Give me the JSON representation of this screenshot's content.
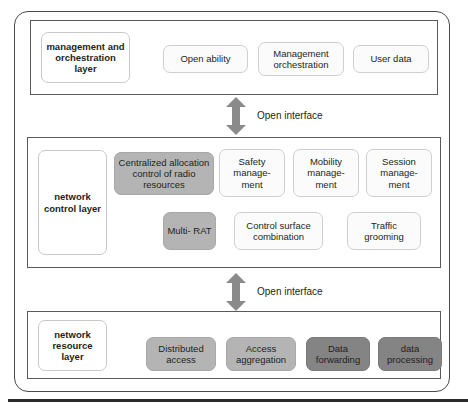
{
  "diagram": {
    "layers": [
      {
        "id": "management-orchestration",
        "label": "management and orchestration layer",
        "nodes": [
          {
            "name": "open-ability",
            "label": "Open ability",
            "style": "plain"
          },
          {
            "name": "management-orchestration",
            "label": "Management orchestration",
            "style": "plain"
          },
          {
            "name": "user-data",
            "label": "User data",
            "style": "plain"
          }
        ]
      },
      {
        "id": "network-control",
        "label": "network control layer",
        "nodes": [
          {
            "name": "centralized-allocation-control",
            "label": "Centralized allocation control of radio resources",
            "style": "gray"
          },
          {
            "name": "safety-management",
            "label": "Safety manage- ment",
            "style": "plain"
          },
          {
            "name": "mobility-management",
            "label": "Mobility manage- ment",
            "style": "plain"
          },
          {
            "name": "session-management",
            "label": "Session manage- ment",
            "style": "plain"
          },
          {
            "name": "multi-rat",
            "label": "Multi- RAT",
            "style": "gray"
          },
          {
            "name": "control-surface-combination",
            "label": "Control surface combination",
            "style": "plain"
          },
          {
            "name": "traffic-grooming",
            "label": "Traffic grooming",
            "style": "plain"
          }
        ]
      },
      {
        "id": "network-resource",
        "label": "network resource layer",
        "nodes": [
          {
            "name": "distributed-access",
            "label": "Distributed access",
            "style": "gray"
          },
          {
            "name": "access-aggregation",
            "label": "Access aggregation",
            "style": "gray"
          },
          {
            "name": "data-forwarding",
            "label": "Data forwarding",
            "style": "dark"
          },
          {
            "name": "data-processing",
            "label": "data processing",
            "style": "dark"
          }
        ]
      }
    ],
    "interfaces": [
      {
        "name": "open-interface-upper",
        "label": "Open interface"
      },
      {
        "name": "open-interface-lower",
        "label": "Open interface"
      }
    ],
    "colors": {
      "frame": "#4a4a4a",
      "layer_border": "#5a5a5a",
      "gray_fill": "#b4b4b4",
      "dark_fill": "#848484",
      "arrow": "#8a8a8a",
      "text": "#231f20"
    }
  }
}
